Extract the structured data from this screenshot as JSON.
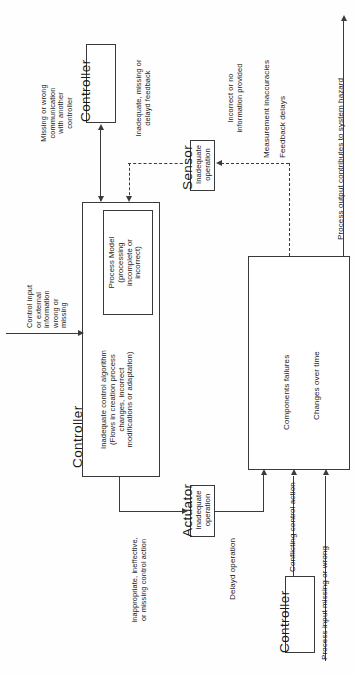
{
  "diagram": {
    "colors": {
      "stroke": "#3a3a3a",
      "text": "#1a1a1a",
      "background": "#fefefe"
    },
    "roles": {
      "controller_top": "Controller",
      "controller_main": "Controller",
      "controller_bottom": "Controller",
      "sensor": "Sensor",
      "actuator": "Actuator"
    },
    "boxes": {
      "process_model": "Process Model\n(processing\nincomplete or\nincorrect)",
      "control_algorithm": "Inadequate control algorithm\n(Flows in creation process\nchanges, incorrect\nmodifications or adaptation)",
      "sensor_inner": "Inadequate\noperation",
      "actuator_inner": "Inadequate\noperation",
      "process_failures": "Components failures",
      "process_changes": "Changes over time"
    },
    "labels": {
      "control_input": "Control input\nor external\ninformation\nwrong or\nmissing",
      "missing_comm": "Missing or wrong\ncommunication\nwith another\ncontroller",
      "inadequate_feedback": "Inadequate, missing or\ndelayd feedback",
      "incorrect_no_info": "Incorrect or no\ninformation provided",
      "measurement_inaccuracies": "Measurement inaccuracies",
      "feedback_delays": "Feedback delays",
      "process_output_hazard": "Process output contributes to system hazard",
      "inappropriate_action": "Inappropriate, ineffective,\nor missing control action",
      "delayd_operation": "Delayd operation",
      "conflicting_action": "Conflicting control action",
      "process_input": "Process input missing or wrong"
    }
  }
}
